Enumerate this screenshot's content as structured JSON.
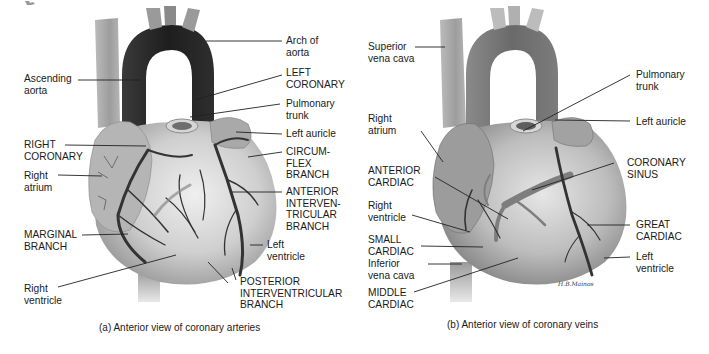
{
  "panel_a": {
    "caption": "(a) Anterior view of coronary arteries",
    "labels": {
      "ascending_aorta": "Ascending\naorta",
      "arch_of_aorta": "Arch of\naorta",
      "left_coronary": "LEFT\nCORONARY",
      "pulmonary_trunk": "Pulmonary\ntrunk",
      "left_auricle": "Left auricle",
      "right_coronary": "RIGHT\nCORONARY",
      "right_atrium": "Right\natrium",
      "circumflex_branch": "CIRCUM-\nFLEX\nBRANCH",
      "anterior_interventricular_branch": "ANTERIOR\nINTERVEN-\nTRICULAR\nBRANCH",
      "marginal_branch": "MARGINAL\nBRANCH",
      "left_ventricle": "Left\nventricle",
      "right_ventricle": "Right\nventricle",
      "posterior_interventricular_branch": "POSTERIOR\nINTERVENTRICULAR\nBRANCH"
    }
  },
  "panel_b": {
    "caption": "(b) Anterior view of coronary veins",
    "signature": "H.B.Mainos",
    "labels": {
      "superior_vena_cava": "Superior\nvena cava",
      "pulmonary_trunk": "Pulmonary\ntrunk",
      "left_auricle": "Left auricle",
      "right_atrium": "Right\natrium",
      "anterior_cardiac": "ANTERIOR\nCARDIAC",
      "coronary_sinus": "CORONARY\nSINUS",
      "right_ventricle": "Right\nventricle",
      "small_cardiac": "SMALL\nCARDIAC",
      "great_cardiac": "GREAT\nCARDIAC",
      "inferior_vena_cava": "Inferior\nvena cava",
      "left_ventricle": "Left\nventricle",
      "middle_cardiac": "MIDDLE\nCARDIAC"
    }
  },
  "colors": {
    "text": "#1a1a1a",
    "leader_line": "#222222",
    "aorta_dark": "#2a2a2a",
    "heart_light": "#d8d8d8",
    "heart_mid": "#a8a8a8",
    "vessel": "#3a3a3a"
  }
}
